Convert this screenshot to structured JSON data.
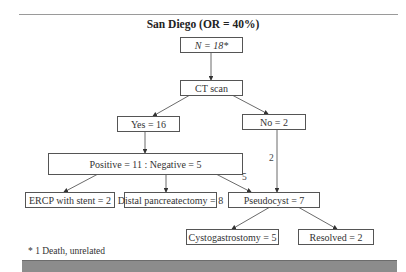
{
  "title": "San Diego (OR = 40%)",
  "nodes": {
    "n": "N = 18*",
    "ct": "CT scan",
    "yes": "Yes = 16",
    "no": "No = 2",
    "posneg": "Positive = 11 :  Negative = 5",
    "ercp": "ERCP with stent = 2",
    "distal": "Distal pancreatectomy = 8",
    "pseudocyst": "Pseudocyst = 7",
    "cysto": "Cystogastrostomy = 5",
    "resolved": "Resolved = 2"
  },
  "edge_labels": {
    "negative_to_pseudocyst": "5",
    "no_to_pseudocyst": "2"
  },
  "footnote": "* 1 Death, unrelated",
  "colors": {
    "box_border": "#555555",
    "bottom_bar": "#8c8c8c"
  }
}
